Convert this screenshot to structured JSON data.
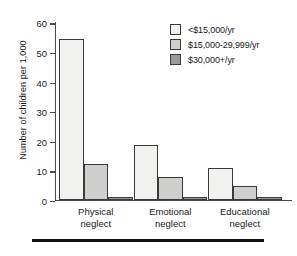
{
  "chart_data": {
    "type": "bar",
    "title": "",
    "xlabel": "",
    "ylabel": "Number of children per 1,000",
    "categories": [
      "Physical neglect",
      "Emotional neglect",
      "Educational neglect"
    ],
    "category_lines": [
      [
        "Physical",
        "neglect"
      ],
      [
        "Emotional",
        "neglect"
      ],
      [
        "Educational",
        "neglect"
      ]
    ],
    "series": [
      {
        "name": "<$15,000/yr",
        "color": "#f2f2f0",
        "values": [
          54.2,
          18.6,
          10.8
        ]
      },
      {
        "name": "$15,000-29,999/yr",
        "color": "#cfcfcd",
        "values": [
          12.2,
          7.8,
          4.5
        ]
      },
      {
        "name": "$30,000+/yr",
        "color": "#9a9a9a",
        "values": [
          1.0,
          0.6,
          0.3
        ]
      }
    ],
    "ylim": [
      0,
      60
    ],
    "yticks": [
      0,
      10,
      20,
      30,
      40,
      50,
      60
    ],
    "ytick_labels": [
      "0",
      "10",
      "20",
      "30",
      "40",
      "50",
      "60"
    ],
    "grid": false,
    "legend_position": "top-right",
    "bar_edge_color": "#3a3a3a",
    "axis_color": "#4a4a4a"
  }
}
